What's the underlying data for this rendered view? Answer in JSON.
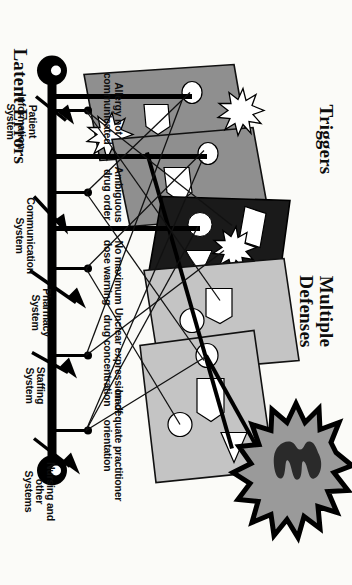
{
  "figure": {
    "type": "swiss-cheese-model-diagram",
    "title_left": "Latent Errors",
    "title_right": "Multiple\nDefenses",
    "title_bottom_left": "Triggers"
  },
  "latent_errors": [
    {
      "id": "allergy",
      "label": "Allergy not\ncommunicated"
    },
    {
      "id": "ambiguous",
      "label": "Ambiguous\ndrug order"
    },
    {
      "id": "no-max-dose",
      "label": "No maximum\ndose warning"
    },
    {
      "id": "unclear-conc",
      "label": "Unclear expression of\ndrug concentration"
    },
    {
      "id": "orientation",
      "label": "Inadequate practitioner\norientation"
    }
  ],
  "defense_layers": [
    {
      "id": "patient-information",
      "label": "Patient\nInformation\nSystem",
      "color": "#8f8f8f"
    },
    {
      "id": "communication",
      "label": "Communication\nSystem",
      "color": "#8f8f8f"
    },
    {
      "id": "pharmacy",
      "label": "Pharmacy\nSystem",
      "color": "#1a1a1a"
    },
    {
      "id": "staffing",
      "label": "Staffing\nSystem",
      "color": "#c4c4c4"
    },
    {
      "id": "nursing-other",
      "label": "Nursing and\nother\nSystems",
      "color": "#c4c4c4"
    }
  ],
  "colors": {
    "slice_light": "#c4c4c4",
    "slice_mid": "#8f8f8f",
    "slice_dark": "#1a1a1a",
    "burst_fill": "#9a9a9a",
    "outline": "#000000",
    "paper": "#fbfbf8"
  },
  "accident_burst": {
    "id": "adverse-event-burst",
    "label": ""
  }
}
